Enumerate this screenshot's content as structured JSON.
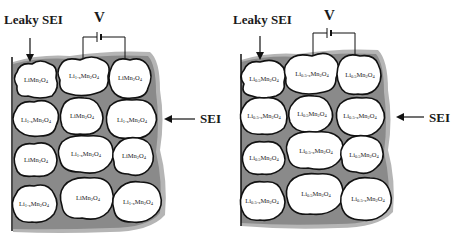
{
  "diagram": {
    "colors": {
      "sei": "#8a8a8a",
      "sei_halo": "#b5b5b5",
      "particle_fill": "#ffffff",
      "outline": "#111111"
    },
    "panels": [
      {
        "leaky_sei_label": "Leaky SEI",
        "voltage_label": "V",
        "sei_label": "SEI",
        "particles": [
          {
            "li": "Li",
            "sub1": "",
            "mn": "Mn",
            "sub2": "2",
            "o": "O",
            "sub3": "4"
          },
          {
            "li": "Li",
            "sub1": "1-x",
            "mn": "Mn",
            "sub2": "2",
            "o": "O",
            "sub3": "4"
          },
          {
            "li": "Li",
            "sub1": "",
            "mn": "Mn",
            "sub2": "2",
            "o": "O",
            "sub3": "4"
          },
          {
            "li": "Li",
            "sub1": "1-x",
            "mn": "Mn",
            "sub2": "2",
            "o": "O",
            "sub3": "4"
          },
          {
            "li": "Li",
            "sub1": "",
            "mn": "Mn",
            "sub2": "2",
            "o": "O",
            "sub3": "4"
          },
          {
            "li": "Li",
            "sub1": "1-x",
            "mn": "Mn",
            "sub2": "2",
            "o": "O",
            "sub3": "4"
          },
          {
            "li": "Li",
            "sub1": "",
            "mn": "Mn",
            "sub2": "2",
            "o": "O",
            "sub3": "4"
          },
          {
            "li": "Li",
            "sub1": "1-x",
            "mn": "Mn",
            "sub2": "2",
            "o": "O",
            "sub3": "4"
          },
          {
            "li": "Li",
            "sub1": "",
            "mn": "Mn",
            "sub2": "2",
            "o": "O",
            "sub3": "4"
          },
          {
            "li": "Li",
            "sub1": "1-x",
            "mn": "Mn",
            "sub2": "2",
            "o": "O",
            "sub3": "4"
          },
          {
            "li": "Li",
            "sub1": "",
            "mn": "Mn",
            "sub2": "2",
            "o": "O",
            "sub3": "4"
          },
          {
            "li": "Li",
            "sub1": "1-x",
            "mn": "Mn",
            "sub2": "2",
            "o": "O",
            "sub3": "4"
          }
        ]
      },
      {
        "leaky_sei_label": "Leaky SEI",
        "voltage_label": "V",
        "sei_label": "SEI",
        "particles": [
          {
            "li": "Li",
            "sub1": "0.5",
            "mn": "Mn",
            "sub2": "2",
            "o": "O",
            "sub3": "4"
          },
          {
            "li": "Li",
            "sub1": "0.5-x",
            "mn": "Mn",
            "sub2": "2",
            "o": "O",
            "sub3": "4"
          },
          {
            "li": "Li",
            "sub1": "0.5",
            "mn": "Mn",
            "sub2": "2",
            "o": "O",
            "sub3": "4"
          },
          {
            "li": "Li",
            "sub1": "0.5-x",
            "mn": "Mn",
            "sub2": "2",
            "o": "O",
            "sub3": "4"
          },
          {
            "li": "Li",
            "sub1": "0.5",
            "mn": "Mn",
            "sub2": "2",
            "o": "O",
            "sub3": "4"
          },
          {
            "li": "Li",
            "sub1": "0.5-x",
            "mn": "Mn",
            "sub2": "2",
            "o": "O",
            "sub3": "4"
          },
          {
            "li": "Li",
            "sub1": "0.5",
            "mn": "Mn",
            "sub2": "2",
            "o": "O",
            "sub3": "4"
          },
          {
            "li": "Li",
            "sub1": "0.5-x",
            "mn": "Mn",
            "sub2": "2",
            "o": "O",
            "sub3": "4"
          },
          {
            "li": "Li",
            "sub1": "0.5",
            "mn": "Mn",
            "sub2": "2",
            "o": "O",
            "sub3": "4"
          },
          {
            "li": "Li",
            "sub1": "0.5-x",
            "mn": "Mn",
            "sub2": "2",
            "o": "O",
            "sub3": "4"
          },
          {
            "li": "Li",
            "sub1": "0.5",
            "mn": "Mn",
            "sub2": "2",
            "o": "O",
            "sub3": "4"
          },
          {
            "li": "Li",
            "sub1": "0.5-x",
            "mn": "Mn",
            "sub2": "2",
            "o": "O",
            "sub3": "4"
          }
        ]
      }
    ]
  }
}
